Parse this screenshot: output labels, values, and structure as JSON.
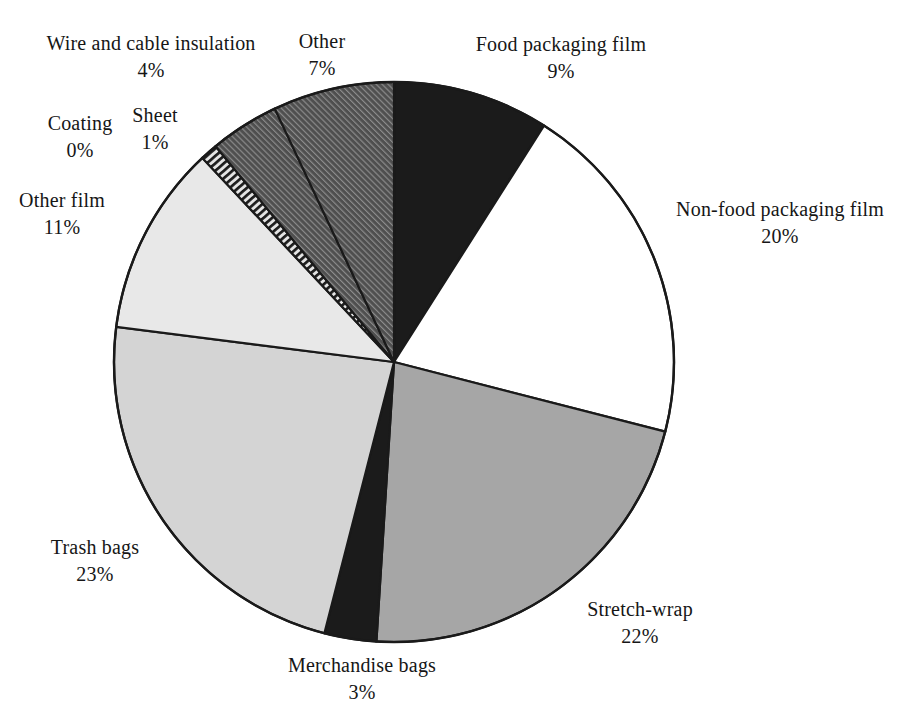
{
  "figure": {
    "background": "#ffffff"
  },
  "chart_data": {
    "type": "pie",
    "title": "",
    "direction": "clockwise",
    "start_angle_deg": 0,
    "legend": "none (labels placed around pie)",
    "outline_color": "#1a1a1a",
    "slices": [
      {
        "id": "food-packaging-film",
        "label": "Food packaging film",
        "value": 9,
        "percent_label": "9%",
        "fill": "black"
      },
      {
        "id": "non-food-packaging-film",
        "label": "Non-food packaging film",
        "value": 20,
        "percent_label": "20%",
        "fill": "white"
      },
      {
        "id": "stretch-wrap",
        "label": "Stretch-wrap",
        "value": 22,
        "percent_label": "22%",
        "fill": "gray-medium"
      },
      {
        "id": "merchandise-bags",
        "label": "Merchandise bags",
        "value": 3,
        "percent_label": "3%",
        "fill": "black"
      },
      {
        "id": "trash-bags",
        "label": "Trash bags",
        "value": 23,
        "percent_label": "23%",
        "fill": "gray-light"
      },
      {
        "id": "other-film",
        "label": "Other film",
        "value": 11,
        "percent_label": "11%",
        "fill": "gray-lighter"
      },
      {
        "id": "coating",
        "label": "Coating",
        "value": 0,
        "percent_label": "0%",
        "fill": "none"
      },
      {
        "id": "sheet",
        "label": "Sheet",
        "value": 1,
        "percent_label": "1%",
        "fill": "ladder"
      },
      {
        "id": "wire-and-cable-insulation",
        "label": "Wire and cable insulation",
        "value": 4,
        "percent_label": "4%",
        "fill": "hatch-dark"
      },
      {
        "id": "other",
        "label": "Other",
        "value": 7,
        "percent_label": "7%",
        "fill": "hatch-dark"
      }
    ],
    "palette": {
      "black": "#1b1b1b",
      "white": "#ffffff",
      "gray-medium": "#a6a6a6",
      "gray-light": "#d4d4d4",
      "gray-lighter": "#e8e8e8",
      "hatch-dark-bg": "#4f4f4f",
      "hatch-dark-line": "#8f8f8f",
      "ladder-bg": "#e4e4e4",
      "ladder-stripe": "#1c1c1c"
    }
  }
}
